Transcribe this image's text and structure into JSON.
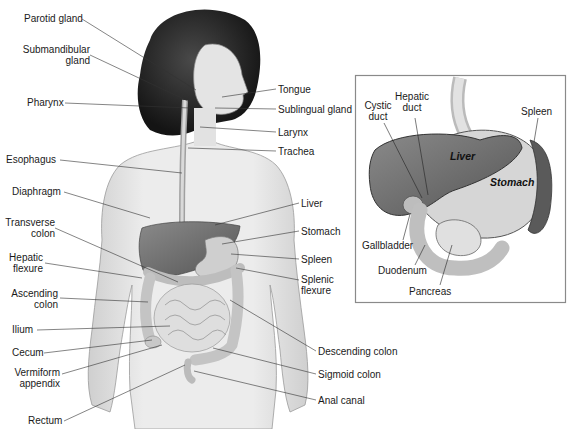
{
  "figure": {
    "left_labels": [
      {
        "id": "parotid-gland",
        "text": "Parotid gland"
      },
      {
        "id": "submandibular-gland",
        "line1": "Submandibular",
        "line2": "gland"
      },
      {
        "id": "pharynx",
        "text": "Pharynx"
      },
      {
        "id": "esophagus",
        "text": "Esophagus"
      },
      {
        "id": "diaphragm",
        "text": "Diaphragm"
      },
      {
        "id": "transverse-colon",
        "line1": "Transverse",
        "line2": "colon"
      },
      {
        "id": "hepatic-flexure",
        "line1": "Hepatic",
        "line2": "flexure"
      },
      {
        "id": "ascending-colon",
        "line1": "Ascending",
        "line2": "colon"
      },
      {
        "id": "ilium",
        "text": "Ilium"
      },
      {
        "id": "cecum",
        "text": "Cecum"
      },
      {
        "id": "vermiform-appendix",
        "line1": "Vermiform",
        "line2": "appendix"
      },
      {
        "id": "rectum",
        "text": "Rectum"
      }
    ],
    "right_labels": [
      {
        "id": "tongue",
        "text": "Tongue"
      },
      {
        "id": "sublingual-gland",
        "text": "Sublingual gland"
      },
      {
        "id": "larynx",
        "text": "Larynx"
      },
      {
        "id": "trachea",
        "text": "Trachea"
      },
      {
        "id": "liver",
        "text": "Liver"
      },
      {
        "id": "stomach",
        "text": "Stomach"
      },
      {
        "id": "spleen",
        "text": "Spleen"
      },
      {
        "id": "splenic-flexure",
        "line1": "Splenic",
        "line2": "flexure"
      },
      {
        "id": "descending-colon",
        "text": "Descending colon"
      },
      {
        "id": "sigmoid-colon",
        "text": "Sigmoid colon"
      },
      {
        "id": "anal-canal",
        "text": "Anal canal"
      }
    ],
    "inset": {
      "labels": [
        {
          "id": "cystic-duct",
          "line1": "Cystic",
          "line2": "duct"
        },
        {
          "id": "hepatic-duct",
          "line1": "Hepatic",
          "line2": "duct"
        },
        {
          "id": "spleen",
          "text": "Spleen"
        },
        {
          "id": "gallbladder",
          "text": "Gallbladder"
        },
        {
          "id": "duodenum",
          "text": "Duodenum"
        },
        {
          "id": "pancreas",
          "text": "Pancreas"
        }
      ],
      "organ_text": {
        "liver": "Liver",
        "stomach": "Stomach"
      }
    },
    "colors": {
      "liver": "#6e6e6e",
      "stomach": "#d4d4d4",
      "skin": "#e9e9e9",
      "hair": "#2a2a2a",
      "leader_line": "#333333",
      "inset_border": "#8a8a8a"
    }
  }
}
